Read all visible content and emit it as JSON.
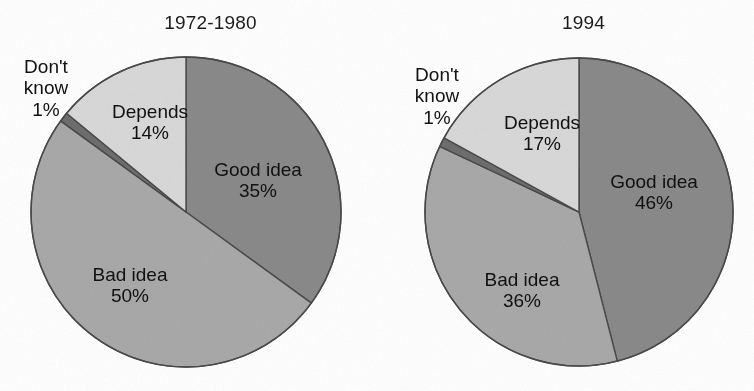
{
  "figure": {
    "background": "#ffffff",
    "text_color": "#111111"
  },
  "palette": {
    "good_idea": "#8a8a8a",
    "bad_idea": "#a9a9a9",
    "depends": "#d9d9d9",
    "dont_know": "#6e6e6e",
    "outline": "#4a4a4a"
  },
  "charts": [
    {
      "title": "1972-1980",
      "slices": [
        {
          "label": "Good idea",
          "value_label": "35%",
          "value": 35,
          "color": "#8a8a8a",
          "label_placement": "inside"
        },
        {
          "label": "Bad idea",
          "value_label": "50%",
          "value": 50,
          "color": "#a9a9a9",
          "label_placement": "inside"
        },
        {
          "label": "Don't know",
          "label_line1": "Don't",
          "label_line2": "know",
          "value_label": "1%",
          "value": 1,
          "color": "#6e6e6e",
          "label_placement": "outside"
        },
        {
          "label": "Depends",
          "value_label": "14%",
          "value": 14,
          "color": "#d9d9d9",
          "label_placement": "inside"
        }
      ]
    },
    {
      "title": "1994",
      "slices": [
        {
          "label": "Good idea",
          "value_label": "46%",
          "value": 46,
          "color": "#8a8a8a",
          "label_placement": "inside"
        },
        {
          "label": "Bad idea",
          "value_label": "36%",
          "value": 36,
          "color": "#a9a9a9",
          "label_placement": "inside"
        },
        {
          "label": "Don't know",
          "label_line1": "Don't",
          "label_line2": "know",
          "value_label": "1%",
          "value": 1,
          "color": "#6e6e6e",
          "label_placement": "outside"
        },
        {
          "label": "Depends",
          "value_label": "17%",
          "value": 17,
          "color": "#d9d9d9",
          "label_placement": "inside"
        }
      ]
    }
  ],
  "chart_data": [
    {
      "type": "pie",
      "title": "1972-1980",
      "categories": [
        "Good idea",
        "Bad idea",
        "Don't know",
        "Depends"
      ],
      "values": [
        35,
        50,
        1,
        14
      ],
      "value_labels": [
        "35%",
        "50%",
        "1%",
        "14%"
      ],
      "colors": [
        "#8a8a8a",
        "#a9a9a9",
        "#6e6e6e",
        "#d9d9d9"
      ],
      "units": "percent",
      "start_angle_deg": 0,
      "direction": "clockwise",
      "legend": "none",
      "labels_on_slices": true,
      "xlabel": "",
      "ylabel": ""
    },
    {
      "type": "pie",
      "title": "1994",
      "categories": [
        "Good idea",
        "Bad idea",
        "Don't know",
        "Depends"
      ],
      "values": [
        46,
        36,
        1,
        17
      ],
      "value_labels": [
        "46%",
        "36%",
        "1%",
        "17%"
      ],
      "colors": [
        "#8a8a8a",
        "#a9a9a9",
        "#6e6e6e",
        "#d9d9d9"
      ],
      "units": "percent",
      "start_angle_deg": 0,
      "direction": "clockwise",
      "legend": "none",
      "labels_on_slices": true,
      "xlabel": "",
      "ylabel": ""
    }
  ]
}
